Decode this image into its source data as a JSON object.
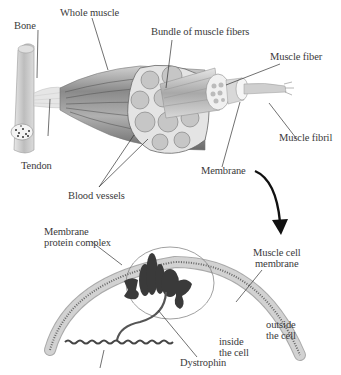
{
  "diagram": {
    "top_section": {
      "title": "Muscle anatomy",
      "labels": {
        "bone": "Bone",
        "whole_muscle": "Whole muscle",
        "bundle": "Bundle of muscle fibers",
        "muscle_fiber": "Muscle fiber",
        "muscle_fibril": "Muscle fibril",
        "tendon": "Tendon",
        "blood_vessels": "Blood vessels",
        "membrane": "Membrane"
      }
    },
    "bottom_section": {
      "labels": {
        "protein_complex_line1": "Membrane",
        "protein_complex_line2": "protein complex",
        "cell_membrane_line1": "Muscle cell",
        "cell_membrane_line2": "membrane",
        "outside_line1": "outside",
        "outside_line2": "the cell",
        "inside_line1": "inside",
        "inside_line2": "the cell",
        "dystrophin": "Dystrophin"
      }
    },
    "colors": {
      "line": "#333333",
      "protein": "#3a3a3a",
      "membrane_bead": "#c8c8c8",
      "muscle_shade": "#9a9a9a",
      "arrow": "#111111"
    }
  }
}
